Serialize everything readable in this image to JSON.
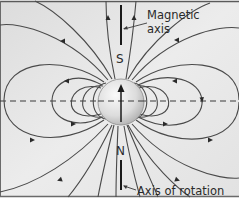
{
  "figure": {
    "type": "magnetic-field-diagram",
    "background_color": "#e6e6e6",
    "line_color": "#4a4a4a",
    "labels": {
      "magnetic_axis_line1": "Magnetic",
      "magnetic_axis_line2": "axis",
      "rotation_axis": "Axis of rotation",
      "south_pole": "S",
      "north_pole": "N"
    },
    "elements": {
      "sphere": "planet-body",
      "equator": "dashed-equator-line",
      "rotation_axis": "vertical-axis-line",
      "magnetic_axis_arrow": "arrow-up-icon",
      "field_lines": "dipole-field-lines"
    }
  }
}
